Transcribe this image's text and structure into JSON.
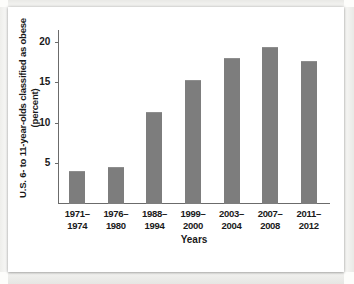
{
  "chart_data": {
    "type": "bar",
    "title": "",
    "xlabel": "Years",
    "ylabel_line1": "U.S. 6- to 11-year-olds classified as obese",
    "ylabel_line2": "(percent)",
    "categories": [
      "1971–\n1974",
      "1976–\n1980",
      "1988–\n1994",
      "1999–\n2000",
      "2003–\n2004",
      "2007–\n2008",
      "2011–\n2012"
    ],
    "category_lines": [
      [
        "1971–",
        "1974"
      ],
      [
        "1976–",
        "1980"
      ],
      [
        "1988–",
        "1994"
      ],
      [
        "1999–",
        "2000"
      ],
      [
        "2003–",
        "2004"
      ],
      [
        "2007–",
        "2008"
      ],
      [
        "2011–",
        "2012"
      ]
    ],
    "values": [
      4.0,
      4.5,
      11.3,
      15.3,
      18.0,
      19.4,
      17.6
    ],
    "ylim": [
      0,
      21.5
    ],
    "yticks": [
      5,
      10,
      15,
      20
    ],
    "ytick_labels": [
      "5",
      "10",
      "15",
      "20"
    ],
    "grid": false,
    "legend": null,
    "bar_color": "#7d7d7d",
    "axis_color": "#6b6b6b",
    "text_color": "#1a1a1a",
    "background_color": "#ffffff"
  }
}
